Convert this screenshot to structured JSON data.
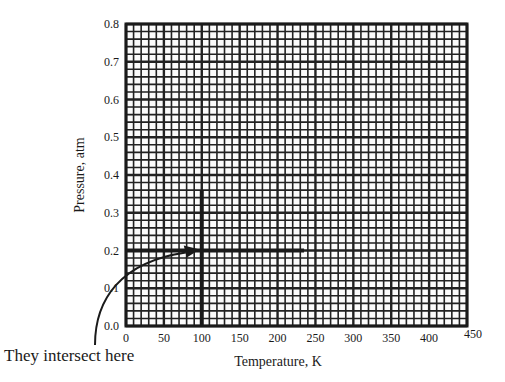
{
  "chart_data": {
    "type": "line",
    "title": "",
    "xlabel": "Temperature, K",
    "ylabel": "Pressure, atm",
    "xlim": [
      0,
      450
    ],
    "ylim": [
      0,
      0.8
    ],
    "x_ticks": [
      "0",
      "50",
      "100",
      "150",
      "200",
      "250",
      "300",
      "350",
      "400",
      "450"
    ],
    "y_ticks": [
      "0.0",
      "0.1",
      "0.2",
      "0.3",
      "0.4",
      "0.5",
      "0.6",
      "0.7",
      "0.8"
    ],
    "grid": {
      "major_x": 50,
      "minor_x": 10,
      "major_y": 0.1,
      "minor_y": 0.02,
      "style": "graph-paper"
    },
    "series": [
      {
        "name": "horizontal line",
        "orientation": "horizontal",
        "y": 0.2,
        "x": [
          0,
          235
        ]
      },
      {
        "name": "vertical line",
        "orientation": "vertical",
        "x": 100,
        "y": [
          0,
          0.36
        ]
      }
    ],
    "intersection": {
      "x": 100,
      "y": 0.2
    },
    "annotations": [
      {
        "text": "They intersect here",
        "arrow_to": {
          "x": 100,
          "y": 0.2
        }
      }
    ]
  },
  "annotation_text": "They intersect here"
}
